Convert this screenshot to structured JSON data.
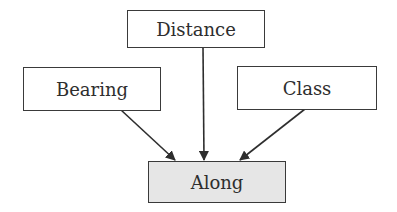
{
  "diagram": {
    "nodes": [
      {
        "id": "distance",
        "label": "Distance"
      },
      {
        "id": "bearing",
        "label": "Bearing"
      },
      {
        "id": "class",
        "label": "Class"
      },
      {
        "id": "along",
        "label": "Along"
      }
    ],
    "edges": [
      {
        "from": "bearing",
        "to": "along"
      },
      {
        "from": "distance",
        "to": "along"
      },
      {
        "from": "class",
        "to": "along"
      }
    ],
    "colors": {
      "target_fill": "#e6e6e6",
      "stroke": "#3a3a3a"
    }
  }
}
